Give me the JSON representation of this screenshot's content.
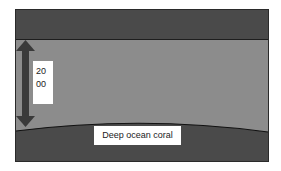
{
  "diagram": {
    "depth_label": "2000",
    "depth_label_lines": [
      "20",
      "00"
    ],
    "seafloor_label": "Deep ocean coral",
    "colors": {
      "surface_band": "#4a4a4a",
      "water": "#8c8c8c",
      "seafloor": "#4a4a4a",
      "arrow": "#3a3a3a",
      "label_bg": "#ffffff"
    }
  }
}
